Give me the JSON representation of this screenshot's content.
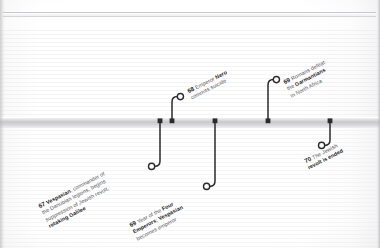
{
  "theme": {
    "background": "#fbfbfb",
    "axis_color": "#c8c8cc",
    "stem_color": "#2b2b2d",
    "text_color": "#555558",
    "emphasis_color": "#1d1d1f"
  },
  "timeline": {
    "title": "",
    "axis_label": "",
    "orientation": "horizontal",
    "events": [
      {
        "id": "event-67-vespasian",
        "year": "67",
        "side": "below",
        "lines": [
          {
            "parts": [
              {
                "text": "Vespasian",
                "emphasis": true
              },
              {
                "text": ", commander of",
                "emphasis": false
              }
            ]
          },
          {
            "parts": [
              {
                "text": "the Danubian legions, begins",
                "emphasis": false
              }
            ]
          },
          {
            "parts": [
              {
                "text": "suppression of Jewish revolt,",
                "emphasis": false
              }
            ]
          },
          {
            "parts": [
              {
                "text": "retaking Galilee",
                "emphasis": true
              }
            ]
          }
        ],
        "text_plain": "67 Vespasian, commander of the Danubian legions, begins suppression of Jewish revolt, retaking Galilee"
      },
      {
        "id": "event-68-nero",
        "year": "68",
        "side": "above",
        "lines": [
          {
            "parts": [
              {
                "text": "Emperor ",
                "emphasis": false
              },
              {
                "text": "Nero",
                "emphasis": true
              }
            ]
          },
          {
            "parts": [
              {
                "text": "commits suicide",
                "emphasis": false
              }
            ]
          }
        ],
        "text_plain": "68 Emperor Nero commits suicide"
      },
      {
        "id": "event-69-four-emperors",
        "year": "69",
        "side": "below",
        "lines": [
          {
            "parts": [
              {
                "text": "Year of the ",
                "emphasis": false
              },
              {
                "text": "Four",
                "emphasis": true
              }
            ]
          },
          {
            "parts": [
              {
                "text": "Emperors",
                "emphasis": true
              },
              {
                "text": "; ",
                "emphasis": false
              },
              {
                "text": "Vespasian",
                "emphasis": true
              }
            ]
          },
          {
            "parts": [
              {
                "text": "becomes emperor",
                "emphasis": false
              }
            ]
          }
        ],
        "text_plain": "69 Year of the Four Emperors; Vespasian becomes emperor"
      },
      {
        "id": "event-69-garmantians",
        "year": "69",
        "side": "above",
        "lines": [
          {
            "parts": [
              {
                "text": "Romans defeat",
                "emphasis": false
              }
            ]
          },
          {
            "parts": [
              {
                "text": "the ",
                "emphasis": false
              },
              {
                "text": "Garmantians",
                "emphasis": true
              }
            ]
          },
          {
            "parts": [
              {
                "text": "in North Africa",
                "emphasis": false
              }
            ]
          }
        ],
        "text_plain": "69 Romans defeat the Garmantians in North Africa"
      },
      {
        "id": "event-70-jewish-revolt",
        "year": "70",
        "side": "below",
        "lines": [
          {
            "parts": [
              {
                "text": "The Jewish",
                "emphasis": false
              }
            ]
          },
          {
            "parts": [
              {
                "text": "revolt is ended",
                "emphasis": true
              }
            ]
          }
        ],
        "text_plain": "70 The Jewish revolt is ended"
      }
    ]
  }
}
